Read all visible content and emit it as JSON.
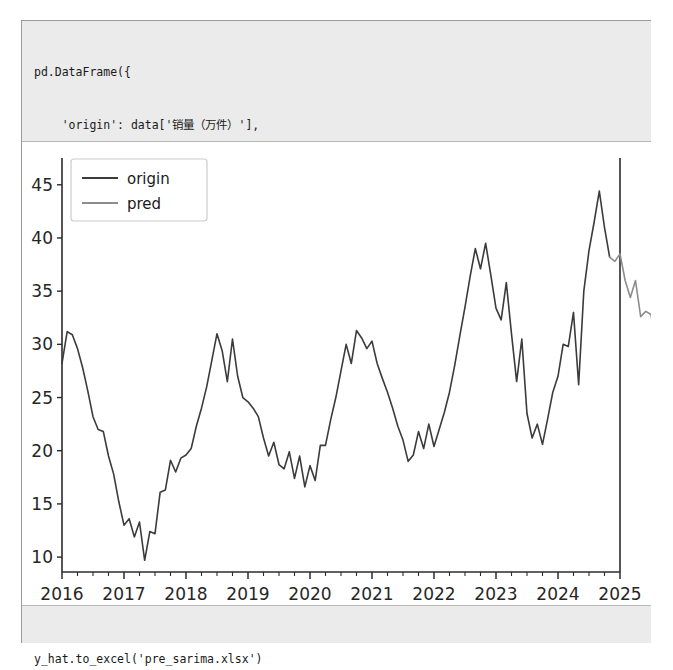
{
  "notebook": {
    "cell_in": {
      "name": "dataframe-plot-code-cell",
      "lines": [
        "pd.DataFrame({",
        "    'origin': data['销量（万件）'],",
        "    'pred': y_hat",
        "}).plot(legend = True)",
        "plt.show()"
      ]
    },
    "cell_out": {
      "name": "to-excel-code-cell",
      "lines": [
        "y_hat.to_excel('pre_sarima.xlsx')"
      ]
    }
  },
  "chart_data": {
    "type": "line",
    "title": "",
    "xlabel": "",
    "ylabel": "",
    "xlim": [
      2016.0,
      2025.0
    ],
    "ylim": [
      8.6,
      46.2
    ],
    "yticks": [
      10,
      15,
      20,
      25,
      30,
      35,
      40,
      45
    ],
    "xticks": [
      2016,
      2017,
      2018,
      2019,
      2020,
      2021,
      2022,
      2023,
      2024,
      2025
    ],
    "xtick_labels": [
      "2016",
      "2017",
      "2018",
      "2019",
      "2020",
      "2021",
      "2022",
      "2023",
      "2024",
      "2025"
    ],
    "minor_xticks_per_year": 4,
    "grid": false,
    "legend_position": "upper left",
    "colors": {
      "origin": "#3b3b3b",
      "pred": "#8c8c8c",
      "axis": "#2b2b2b",
      "legend_border": "#cccccc",
      "background": "#ffffff"
    },
    "series": [
      {
        "name": "origin",
        "label": "origin",
        "color": "#3b3b3b",
        "x_start": 2016.0,
        "x_step": 0.08333,
        "values": [
          28.2,
          31.2,
          30.9,
          29.6,
          27.8,
          25.6,
          23.2,
          22.0,
          21.8,
          19.5,
          17.8,
          15.2,
          13.0,
          13.6,
          11.9,
          13.3,
          9.7,
          12.4,
          12.2,
          16.1,
          16.3,
          19.1,
          18.0,
          19.3,
          19.6,
          20.2,
          22.3,
          24.0,
          26.0,
          28.5,
          31.0,
          29.4,
          26.5,
          30.5,
          27.0,
          25.0,
          24.6,
          24.0,
          23.2,
          21.2,
          19.5,
          20.8,
          18.7,
          18.3,
          19.9,
          17.4,
          19.5,
          16.6,
          18.6,
          17.2,
          20.5,
          20.5,
          22.9,
          25.0,
          27.5,
          30.0,
          28.2,
          31.3,
          30.6,
          29.6,
          30.3,
          28.2,
          26.8,
          25.5,
          24.0,
          22.3,
          21.0,
          19.0,
          19.6,
          21.8,
          20.2,
          22.5,
          20.4,
          22.0,
          23.6,
          25.5,
          28.0,
          30.8,
          33.5,
          36.4,
          39.0,
          37.1,
          39.5,
          36.5,
          33.4,
          32.3,
          35.8,
          31.0,
          26.5,
          30.5,
          23.5,
          21.2,
          22.5,
          20.6,
          23.0,
          25.5,
          27.0,
          30.0,
          29.8,
          33.0,
          26.2,
          35.0,
          38.8,
          41.5,
          44.4,
          41.0,
          38.2
        ]
      },
      {
        "name": "pred",
        "label": "pred",
        "color": "#8c8c8c",
        "x_start": 2024.8333,
        "x_step": 0.08333,
        "values": [
          38.2,
          37.8,
          38.5,
          36.0,
          34.4,
          36.0,
          32.6,
          33.1,
          32.8,
          29.8
        ]
      }
    ]
  }
}
